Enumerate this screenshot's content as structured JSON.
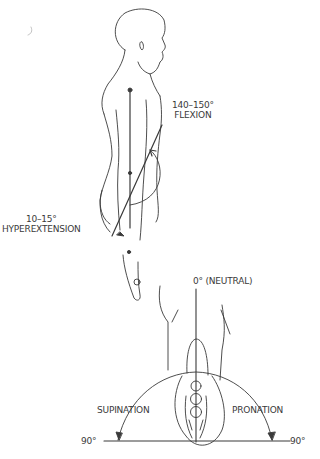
{
  "figure": {
    "shoulder": {
      "flexion": {
        "range": "140–150°",
        "label": "FLEXION"
      },
      "hyperextension": {
        "range": "10–15°",
        "label": "HYPEREXTENSION"
      }
    },
    "forearm": {
      "neutral": "0° (NEUTRAL)",
      "supination": "SUPINATION",
      "pronation": "PRONATION",
      "left_end": "90°",
      "right_end": "90°"
    }
  },
  "colors": {
    "ink": "#3a3a3a",
    "background": "#ffffff"
  }
}
